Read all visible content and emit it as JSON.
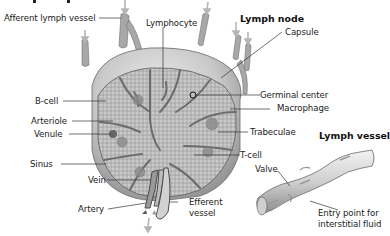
{
  "figure": {
    "section_titles": {
      "lymph_node": "Lymph node",
      "lymph_vessel": "Lymph vessel"
    },
    "lymph_node_labels": {
      "afferent_lymph_vessel": "Afferent lymph vessel",
      "lymphocyte": "Lymphocyte",
      "capsule": "Capsule",
      "b_cell": "B-cell",
      "arteriole": "Arteriole",
      "venule": "Venule",
      "sinus": "Sinus",
      "vein": "Vein",
      "artery": "Artery",
      "germinal_center": "Germinal center",
      "macrophage": "Macrophage",
      "trabeculae": "Trabeculae",
      "t_cell": "T-cell",
      "efferent_vessel_line1": "Efferent",
      "efferent_vessel_line2": "vessel"
    },
    "lymph_vessel_labels": {
      "valve": "Valve",
      "entry_point_line1": "Entry point for",
      "entry_point_line2": "interstitial fluid"
    },
    "colors": {
      "background": "#ffffff",
      "tissue_gray": "#9a9a9a",
      "capsule_light": "#d8d8d8",
      "leader_line": "#333333",
      "arrow_gray": "#b5b5b5"
    }
  }
}
